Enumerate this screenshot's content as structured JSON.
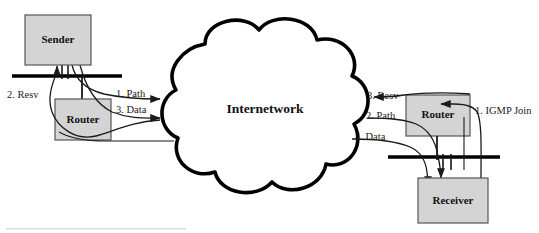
{
  "diagram": {
    "title": "Internetwork",
    "nodes": [
      {
        "id": "sender",
        "label": "Sender",
        "kind": "host-box",
        "fill": "#d4d4d4"
      },
      {
        "id": "router_l",
        "label": "Router",
        "kind": "router-box",
        "fill": "#d4d4d4"
      },
      {
        "id": "cloud",
        "label": "Internetwork",
        "kind": "cloud",
        "fill": "#ffffff"
      },
      {
        "id": "router_r",
        "label": "Router",
        "kind": "router-box",
        "fill": "#d4d4d4"
      },
      {
        "id": "receiver",
        "label": "Receiver",
        "kind": "host-box",
        "fill": "#d4d4d4"
      }
    ],
    "flows": [
      {
        "id": "flow-resv-left",
        "label": "2. Resv",
        "side": "left"
      },
      {
        "id": "flow-path-left",
        "label": "1. Path",
        "side": "left"
      },
      {
        "id": "flow-data-left",
        "label": "3. Data",
        "side": "left"
      },
      {
        "id": "flow-resv-right",
        "label": "3. Resv",
        "side": "right"
      },
      {
        "id": "flow-path-right",
        "label": "2. Path",
        "side": "right"
      },
      {
        "id": "flow-data-right",
        "label": "4. Data",
        "side": "right"
      },
      {
        "id": "flow-igmp-join",
        "label": "1. IGMP Join",
        "side": "right"
      }
    ],
    "colors": {
      "box_fill": "#d4d4d4",
      "box_stroke": "#555555",
      "line": "#1a1a1a",
      "cloud_stroke": "#000000",
      "bus": "#000000"
    }
  }
}
